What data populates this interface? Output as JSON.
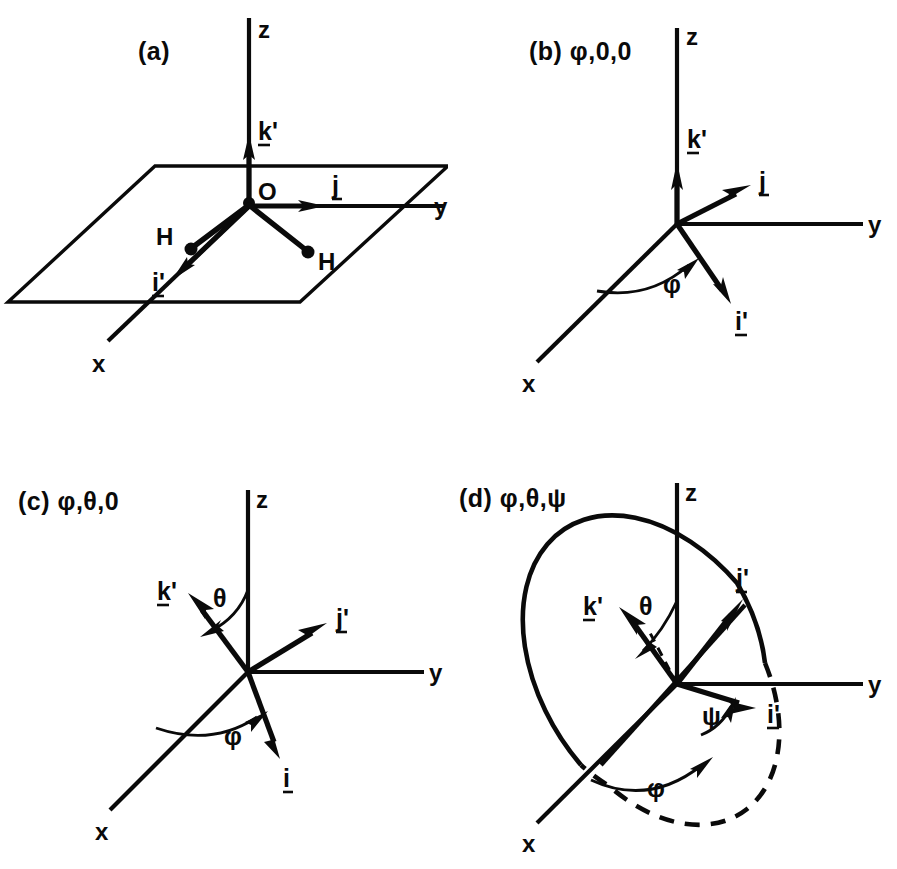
{
  "figure": {
    "background_color": "#ffffff",
    "ink_color": "#0a0a0a",
    "panel_count": 4
  },
  "panels": [
    {
      "id": "a",
      "label": "(a)",
      "angle_spec": "",
      "caption_full": "(a)",
      "description": "Unrotated body frame coincident with the space frame; water molecule in the x'-z' plane with O at origin and two H atoms.",
      "axes": [
        {
          "name": "z",
          "label": "z"
        },
        {
          "name": "y",
          "label": "y"
        },
        {
          "name": "x",
          "label": "x"
        }
      ],
      "vectors": [
        {
          "name": "k-prime",
          "label": "k'",
          "underlined": true
        },
        {
          "name": "j",
          "label": "j",
          "underlined": true
        },
        {
          "name": "i-prime",
          "label": "i'",
          "underlined": true
        }
      ],
      "atoms": [
        {
          "name": "oxygen",
          "label": "O"
        },
        {
          "name": "hydrogen-left",
          "label": "H"
        },
        {
          "name": "hydrogen-right",
          "label": "H"
        }
      ],
      "angles": [],
      "has_plane": true,
      "has_disk": false
    },
    {
      "id": "b",
      "label": "(b)",
      "angle_spec": "φ,0,0",
      "caption_full": "(b) φ,0,0",
      "description": "First Euler rotation by phi about the z axis.",
      "axes": [
        {
          "name": "z",
          "label": "z"
        },
        {
          "name": "y",
          "label": "y"
        },
        {
          "name": "x",
          "label": "x"
        }
      ],
      "vectors": [
        {
          "name": "k-prime",
          "label": "k'",
          "underlined": true
        },
        {
          "name": "j",
          "label": "j",
          "underlined": true
        },
        {
          "name": "i-prime",
          "label": "i'",
          "underlined": true
        }
      ],
      "atoms": [],
      "angles": [
        {
          "name": "phi",
          "label": "φ",
          "from_axis": "x",
          "to_vector": "i'"
        }
      ],
      "has_plane": false,
      "has_disk": false
    },
    {
      "id": "c",
      "label": "(c)",
      "angle_spec": "φ,θ,0",
      "caption_full": "(c) φ,θ,0",
      "description": "Second Euler rotation by theta tilting k' away from z.",
      "axes": [
        {
          "name": "z",
          "label": "z"
        },
        {
          "name": "y",
          "label": "y"
        },
        {
          "name": "x",
          "label": "x"
        }
      ],
      "vectors": [
        {
          "name": "k-prime",
          "label": "k'",
          "underlined": true
        },
        {
          "name": "j-prime",
          "label": "j'",
          "underlined": true
        },
        {
          "name": "i",
          "label": "i",
          "underlined": true
        }
      ],
      "atoms": [],
      "angles": [
        {
          "name": "theta",
          "label": "θ",
          "from_axis": "z",
          "to_vector": "k'"
        },
        {
          "name": "phi",
          "label": "φ",
          "from_axis": "x",
          "to_vector": "i"
        }
      ],
      "has_plane": false,
      "has_disk": false
    },
    {
      "id": "d",
      "label": "(d)",
      "angle_spec": "φ,θ,ψ",
      "caption_full": "(d) φ,θ,ψ",
      "description": "Third Euler rotation by psi about k'; the tilted body plane is shown as an ellipse with a dashed hidden half.",
      "axes": [
        {
          "name": "z",
          "label": "z"
        },
        {
          "name": "y",
          "label": "y"
        },
        {
          "name": "x",
          "label": "x"
        }
      ],
      "vectors": [
        {
          "name": "k-prime",
          "label": "k'",
          "underlined": true
        },
        {
          "name": "j-prime",
          "label": "j'",
          "underlined": true
        },
        {
          "name": "i-prime",
          "label": "i'",
          "underlined": true
        }
      ],
      "atoms": [],
      "angles": [
        {
          "name": "theta",
          "label": "θ",
          "from_axis": "z",
          "to_vector": "k'"
        },
        {
          "name": "phi",
          "label": "φ",
          "from_axis": "x",
          "to_vector": "line-of-nodes"
        },
        {
          "name": "psi",
          "label": "ψ",
          "from_axis": "line-of-nodes",
          "to_vector": "i'"
        }
      ],
      "has_plane": false,
      "has_disk": true
    }
  ],
  "symbols": {
    "phi": "φ",
    "theta": "θ",
    "psi": "ψ",
    "zero": "0",
    "comma": ","
  },
  "labels": {
    "axis_z": "z",
    "axis_y": "y",
    "axis_x": "x",
    "vec_k_prime": "k'",
    "vec_j": "j",
    "vec_j_prime": "j'",
    "vec_i": "i",
    "vec_i_prime": "i'",
    "atom_o": "O",
    "atom_h": "H"
  }
}
